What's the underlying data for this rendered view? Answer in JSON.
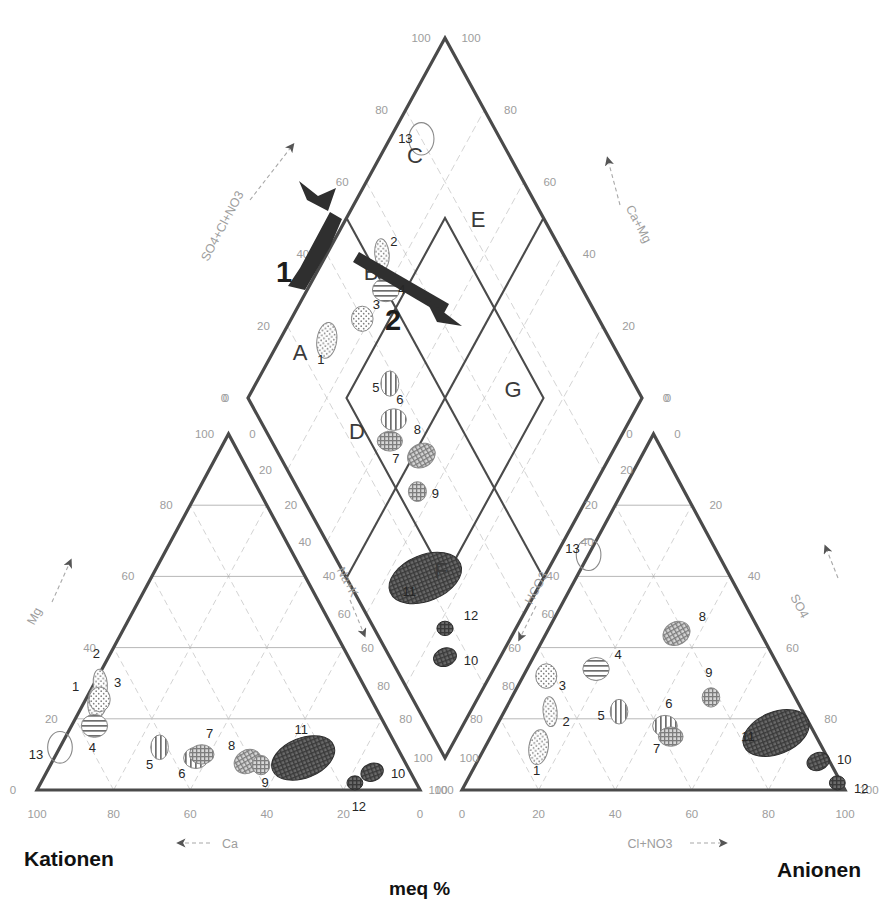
{
  "figure": {
    "type": "piper-diagram",
    "bottom_center_label": "meq %",
    "left_corner_label": "Kationen",
    "right_corner_label": "Anionen"
  },
  "axes": {
    "diamond_left": {
      "label": "SO4+Cl+NO3",
      "ticks": [
        "0",
        "20",
        "40",
        "60",
        "80",
        "100"
      ],
      "arrow": "up-right"
    },
    "diamond_right": {
      "label": "Ca+Mg",
      "ticks": [
        "0",
        "20",
        "40",
        "60",
        "80",
        "100"
      ],
      "arrow": "up-right"
    },
    "diamond_lower_left": {
      "label": "Na+K",
      "arrow": "down-right"
    },
    "diamond_lower_right": {
      "label": "HCO3",
      "arrow": "down-left"
    },
    "cation_left": {
      "label": "Mg",
      "ticks": [
        "0",
        "20",
        "40",
        "60",
        "80",
        "100"
      ],
      "arrow": "up-left"
    },
    "cation_right": {
      "label": "Na+K",
      "ticks": [
        "0",
        "20",
        "40",
        "60",
        "80",
        "100"
      ],
      "arrow": "down-right"
    },
    "cation_bottom": {
      "label": "Ca",
      "ticks": [
        "100",
        "80",
        "60",
        "40",
        "20",
        "0"
      ],
      "arrow": "left"
    },
    "anion_left": {
      "label": "HCO3",
      "ticks": [
        "100",
        "80",
        "60",
        "40",
        "20",
        "0"
      ],
      "arrow": "down-left"
    },
    "anion_right": {
      "label": "SO4",
      "ticks": [
        "0",
        "20",
        "40",
        "60",
        "80",
        "100"
      ],
      "arrow": "up-right"
    },
    "anion_bottom": {
      "label": "Cl+NO3",
      "ticks": [
        "0",
        "20",
        "40",
        "60",
        "80",
        "100"
      ],
      "arrow": "right"
    }
  },
  "diamond_regions": [
    {
      "id": "A",
      "label": "A"
    },
    {
      "id": "B",
      "label": "B"
    },
    {
      "id": "C",
      "label": "C"
    },
    {
      "id": "D",
      "label": "D"
    },
    {
      "id": "E",
      "label": "E"
    },
    {
      "id": "F",
      "label": "F"
    },
    {
      "id": "G",
      "label": "G"
    }
  ],
  "trend_arrows": [
    {
      "label": "1",
      "direction": "up-left",
      "note": "thick black arrow pointing up-left in diamond"
    },
    {
      "label": "2",
      "direction": "down-right",
      "note": "thick black arrow pointing down-right in diamond"
    }
  ],
  "groups": [
    {
      "id": 1,
      "fill": "dots-sparse"
    },
    {
      "id": 2,
      "fill": "dots-sparse"
    },
    {
      "id": 3,
      "fill": "dots-sparse"
    },
    {
      "id": 4,
      "fill": "hatch-horizontal"
    },
    {
      "id": 5,
      "fill": "hatch-vertical"
    },
    {
      "id": 6,
      "fill": "hatch-vertical"
    },
    {
      "id": 7,
      "fill": "crosshatch-medium"
    },
    {
      "id": 8,
      "fill": "crosshatch-medium"
    },
    {
      "id": 9,
      "fill": "crosshatch-medium"
    },
    {
      "id": 10,
      "fill": "crosshatch-dark"
    },
    {
      "id": 11,
      "fill": "crosshatch-dark"
    },
    {
      "id": 12,
      "fill": "crosshatch-dark"
    },
    {
      "id": 13,
      "fill": "outline-only"
    }
  ],
  "chart_data": {
    "type": "scatter",
    "title": "",
    "xlabel": "meq %",
    "ylabel": "",
    "grid": true,
    "legend": "none",
    "cation_triangle": {
      "vertices": {
        "Mg": "top",
        "Ca": "bottom-left",
        "Na+K": "bottom-right"
      },
      "axis_ranges": [
        0,
        100
      ],
      "points": [
        {
          "id": 1,
          "Ca": 86,
          "Mg": 30,
          "NaK": 4,
          "fill": "dots-sparse"
        },
        {
          "id": 2,
          "Ca": 83,
          "Mg": 36,
          "NaK": 2,
          "fill": "dots-sparse"
        },
        {
          "id": 3,
          "Ca": 78,
          "Mg": 28,
          "NaK": 4,
          "fill": "dots-sparse"
        },
        {
          "id": 4,
          "Ca": 76,
          "Mg": 18,
          "NaK": 6,
          "fill": "hatch-horizontal"
        },
        {
          "id": 5,
          "Ca": 62,
          "Mg": 12,
          "NaK": 26,
          "fill": "hatch-vertical"
        },
        {
          "id": 6,
          "Ca": 54,
          "Mg": 9,
          "NaK": 37,
          "fill": "hatch-vertical"
        },
        {
          "id": 7,
          "Ca": 52,
          "Mg": 10,
          "NaK": 38,
          "fill": "crosshatch-medium"
        },
        {
          "id": 8,
          "Ca": 41,
          "Mg": 8,
          "NaK": 51,
          "fill": "crosshatch-medium"
        },
        {
          "id": 9,
          "Ca": 38,
          "Mg": 7,
          "NaK": 55,
          "fill": "crosshatch-medium"
        },
        {
          "id": 10,
          "Ca": 10,
          "Mg": 5,
          "NaK": 85,
          "fill": "crosshatch-dark"
        },
        {
          "id": 11,
          "Ca": 26,
          "Mg": 9,
          "NaK": 65,
          "fill": "crosshatch-dark"
        },
        {
          "id": 12,
          "Ca": 16,
          "Mg": 2,
          "NaK": 82,
          "fill": "crosshatch-dark"
        },
        {
          "id": 13,
          "Ca": 88,
          "Mg": 12,
          "NaK": 0,
          "fill": "outline-only"
        }
      ]
    },
    "anion_triangle": {
      "vertices": {
        "SO4": "top",
        "HCO3": "bottom-left",
        "ClNO3": "bottom-right"
      },
      "axis_ranges": [
        0,
        100
      ],
      "points": [
        {
          "id": 1,
          "HCO3": 74,
          "SO4": 12,
          "ClNO3": 14,
          "fill": "dots-sparse"
        },
        {
          "id": 2,
          "HCO3": 66,
          "SO4": 22,
          "ClNO3": 12,
          "fill": "dots-sparse"
        },
        {
          "id": 3,
          "HCO3": 62,
          "SO4": 32,
          "ClNO3": 6,
          "fill": "dots-sparse"
        },
        {
          "id": 4,
          "HCO3": 48,
          "SO4": 34,
          "ClNO3": 18,
          "fill": "hatch-horizontal"
        },
        {
          "id": 5,
          "HCO3": 48,
          "SO4": 22,
          "ClNO3": 30,
          "fill": "hatch-vertical"
        },
        {
          "id": 6,
          "HCO3": 38,
          "SO4": 18,
          "ClNO3": 44,
          "fill": "hatch-vertical"
        },
        {
          "id": 7,
          "HCO3": 38,
          "SO4": 15,
          "ClNO3": 47,
          "fill": "crosshatch-medium"
        },
        {
          "id": 8,
          "HCO3": 22,
          "SO4": 44,
          "ClNO3": 34,
          "fill": "crosshatch-medium"
        },
        {
          "id": 9,
          "HCO3": 22,
          "SO4": 26,
          "ClNO3": 52,
          "fill": "crosshatch-medium"
        },
        {
          "id": 10,
          "HCO3": 3,
          "SO4": 8,
          "ClNO3": 89,
          "fill": "crosshatch-dark"
        },
        {
          "id": 11,
          "HCO3": 10,
          "SO4": 16,
          "ClNO3": 74,
          "fill": "crosshatch-dark"
        },
        {
          "id": 12,
          "HCO3": 1,
          "SO4": 2,
          "ClNO3": 97,
          "fill": "crosshatch-dark"
        },
        {
          "id": 13,
          "HCO3": 40,
          "SO4": 78,
          "ClNO3": 0,
          "fill": "outline-only"
        }
      ]
    },
    "diamond": {
      "x_axis": "Ca+Mg  /  Na+K",
      "y_axis": "SO4+Cl+NO3  /  HCO3",
      "axis_ranges": [
        0,
        100
      ],
      "points": [
        {
          "id": 1,
          "CaMg": 88,
          "SO4ClNO3": 28,
          "fill": "dots-sparse"
        },
        {
          "id": 2,
          "CaMg": 86,
          "SO4ClNO3": 54,
          "fill": "dots-sparse"
        },
        {
          "id": 3,
          "CaMg": 82,
          "SO4ClNO3": 40,
          "fill": "dots-sparse"
        },
        {
          "id": 4,
          "CaMg": 80,
          "SO4ClNO3": 50,
          "fill": "hatch-horizontal"
        },
        {
          "id": 5,
          "CaMg": 66,
          "SO4ClNO3": 38,
          "fill": "hatch-vertical"
        },
        {
          "id": 6,
          "CaMg": 60,
          "SO4ClNO3": 34,
          "fill": "hatch-vertical"
        },
        {
          "id": 7,
          "CaMg": 58,
          "SO4ClNO3": 30,
          "fill": "crosshatch-medium"
        },
        {
          "id": 8,
          "CaMg": 48,
          "SO4ClNO3": 36,
          "fill": "crosshatch-medium"
        },
        {
          "id": 9,
          "CaMg": 44,
          "SO4ClNO3": 30,
          "fill": "crosshatch-medium"
        },
        {
          "id": 10,
          "CaMg": 14,
          "SO4ClNO3": 14,
          "fill": "crosshatch-dark"
        },
        {
          "id": 11,
          "CaMg": 30,
          "SO4ClNO3": 20,
          "fill": "crosshatch-dark"
        },
        {
          "id": 12,
          "CaMg": 18,
          "SO4ClNO3": 18,
          "fill": "crosshatch-dark"
        },
        {
          "id": 13,
          "CaMg": 92,
          "SO4ClNO3": 80,
          "fill": "outline-only"
        }
      ]
    }
  }
}
